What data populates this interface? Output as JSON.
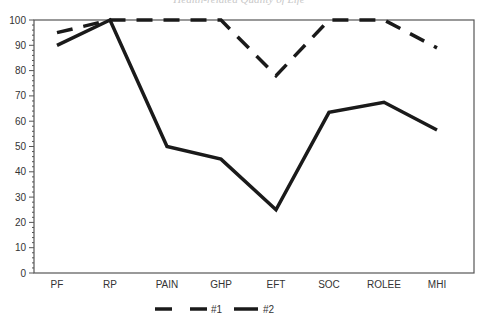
{
  "title": "Health-related Quality of Life",
  "chart_data": {
    "type": "line",
    "title": "Health-related Quality of Life",
    "xlabel": "",
    "ylabel": "",
    "categories": [
      "PF",
      "RP",
      "PAIN",
      "GHP",
      "EFT",
      "SOC",
      "ROLEE",
      "MHI"
    ],
    "ylim": [
      0,
      100
    ],
    "yticks": [
      0,
      10,
      20,
      30,
      40,
      50,
      60,
      70,
      80,
      90,
      100
    ],
    "grid": false,
    "legend_position": "bottom",
    "series": [
      {
        "name": "#1",
        "style": "dashed",
        "values": [
          95,
          100,
          100,
          100,
          78,
          100,
          100,
          89
        ]
      },
      {
        "name": "#2",
        "style": "solid",
        "values": [
          90,
          100,
          50,
          45,
          25,
          63.5,
          67.5,
          56.5
        ]
      }
    ]
  },
  "legend": [
    {
      "label": "#1",
      "style": "dashed"
    },
    {
      "label": "#2",
      "style": "solid"
    }
  ],
  "colors": {
    "line": "#1a1a1a",
    "axis": "#555555",
    "text": "#333333"
  }
}
